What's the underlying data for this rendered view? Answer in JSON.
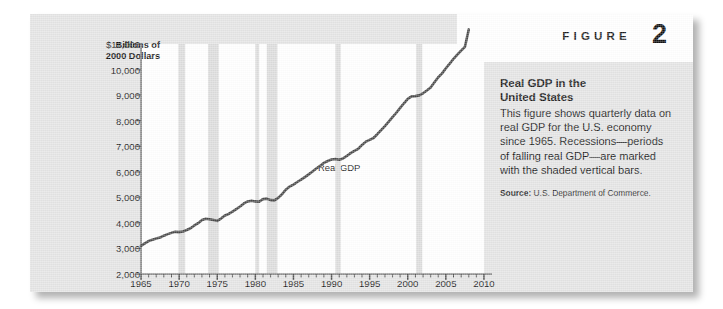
{
  "figure": {
    "label": "FIGURE",
    "number": "2"
  },
  "panel": {
    "title_line1": "Real GDP in the",
    "title_line2": "United States",
    "body": "This figure shows quarterly data on real GDP for the U.S. economy since 1965. Recessions—periods of falling real GDP—are marked with the shaded vertical bars.",
    "source_label": "Source:",
    "source_text": " U.S. Department of Commerce."
  },
  "chart_data": {
    "type": "line",
    "title": "Real GDP in the United States",
    "series_label": "Real GDP",
    "ylabel_line1": "Billions of",
    "ylabel_line2": "2000 Dollars",
    "xlabel": "",
    "xlim": [
      1965,
      2010
    ],
    "ylim": [
      2000,
      11000
    ],
    "ytick_labels": [
      "$11,000",
      "10,000",
      "9,000",
      "8,000",
      "7,000",
      "6,000",
      "5,000",
      "4,000",
      "3,000",
      "2,000"
    ],
    "ytick_values": [
      11000,
      10000,
      9000,
      8000,
      7000,
      6000,
      5000,
      4000,
      3000,
      2000
    ],
    "xtick_labels": [
      "1965",
      "1970",
      "1975",
      "1980",
      "1985",
      "1990",
      "1995",
      "2000",
      "2005",
      "2010"
    ],
    "xtick_values": [
      1965,
      1970,
      1975,
      1980,
      1985,
      1990,
      1995,
      2000,
      2005,
      2010
    ],
    "grid": false,
    "legend": "none",
    "line_color": "#4a4a4a",
    "recession_color": "#dcdcdc",
    "recessions": [
      {
        "start": 1969.9,
        "end": 1970.8
      },
      {
        "start": 1973.8,
        "end": 1975.2
      },
      {
        "start": 1980.0,
        "end": 1980.5
      },
      {
        "start": 1981.5,
        "end": 1982.9
      },
      {
        "start": 1990.5,
        "end": 1991.2
      },
      {
        "start": 2001.1,
        "end": 2001.9
      }
    ],
    "x": [
      1965.0,
      1965.5,
      1966.0,
      1966.5,
      1967.0,
      1967.5,
      1968.0,
      1968.5,
      1969.0,
      1969.5,
      1970.0,
      1970.5,
      1971.0,
      1971.5,
      1972.0,
      1972.5,
      1973.0,
      1973.5,
      1974.0,
      1974.5,
      1975.0,
      1975.5,
      1976.0,
      1976.5,
      1977.0,
      1977.5,
      1978.0,
      1978.5,
      1979.0,
      1979.5,
      1980.0,
      1980.5,
      1981.0,
      1981.5,
      1982.0,
      1982.5,
      1983.0,
      1983.5,
      1984.0,
      1984.5,
      1985.0,
      1985.5,
      1986.0,
      1986.5,
      1987.0,
      1987.5,
      1988.0,
      1988.5,
      1989.0,
      1989.5,
      1990.0,
      1990.5,
      1991.0,
      1991.5,
      1992.0,
      1992.5,
      1993.0,
      1993.5,
      1994.0,
      1994.5,
      1995.0,
      1995.5,
      1996.0,
      1996.5,
      1997.0,
      1997.5,
      1998.0,
      1998.5,
      1999.0,
      1999.5,
      2000.0,
      2000.5,
      2001.0,
      2001.5,
      2002.0,
      2002.5,
      2003.0,
      2003.5,
      2004.0,
      2004.5,
      2005.0,
      2005.5,
      2006.0,
      2006.5,
      2007.0,
      2007.5,
      2008.0
    ],
    "y": [
      3100,
      3200,
      3290,
      3340,
      3390,
      3430,
      3500,
      3560,
      3610,
      3650,
      3640,
      3660,
      3720,
      3790,
      3900,
      3990,
      4110,
      4160,
      4140,
      4110,
      4080,
      4170,
      4290,
      4350,
      4440,
      4540,
      4640,
      4760,
      4840,
      4870,
      4840,
      4830,
      4930,
      4950,
      4890,
      4880,
      4980,
      5120,
      5300,
      5420,
      5500,
      5600,
      5690,
      5790,
      5900,
      6010,
      6130,
      6230,
      6350,
      6420,
      6480,
      6500,
      6470,
      6520,
      6620,
      6730,
      6820,
      6900,
      7050,
      7180,
      7250,
      7320,
      7470,
      7630,
      7790,
      7960,
      8140,
      8310,
      8500,
      8680,
      8850,
      8950,
      8960,
      8990,
      9070,
      9180,
      9300,
      9500,
      9700,
      9850,
      10050,
      10230,
      10420,
      10580,
      10740,
      10890,
      11570
    ]
  }
}
